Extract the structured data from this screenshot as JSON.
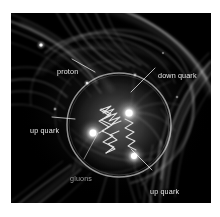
{
  "figure": {
    "alt_description": "Scientific illustration of the internal structure of a proton showing three valence quarks bound by gluon fields",
    "background_color": "#ffffff",
    "plate_color": "#000000",
    "label_color": "#e8e8e8",
    "glow_color": "#ffffff"
  },
  "annotations": [
    {
      "id": "proton",
      "label": "proton",
      "text_x": 46,
      "text_y": 55,
      "leader": {
        "x1": 72,
        "y1": 59,
        "x2": 95,
        "y2": 72
      },
      "dim": false
    },
    {
      "id": "down-quark",
      "label": "down quark",
      "text_x": 147,
      "text_y": 59,
      "leader": {
        "x1": 155,
        "y1": 68,
        "x2": 131,
        "y2": 92
      },
      "dim": false
    },
    {
      "id": "up-quark-left",
      "label": "up quark",
      "text_x": 19,
      "text_y": 114,
      "leader": {
        "x1": 52,
        "y1": 117,
        "x2": 75,
        "y2": 119
      },
      "dim": false
    },
    {
      "id": "gluons",
      "label": "gluons",
      "text_x": 59,
      "text_y": 162,
      "leader": {
        "x1": 84,
        "y1": 159,
        "x2": 98,
        "y2": 133
      },
      "dim": true
    },
    {
      "id": "up-quark-right",
      "label": "up quark",
      "text_x": 139,
      "text_y": 175,
      "leader": {
        "x1": 152,
        "y1": 170,
        "x2": 131,
        "y2": 149
      },
      "dim": false
    }
  ],
  "quarks": [
    {
      "id": "down-quark-node",
      "name": "down quark",
      "cx": 118,
      "cy": 100,
      "r": 7
    },
    {
      "id": "up-quark-node-left",
      "name": "up quark",
      "cx": 82,
      "cy": 120,
      "r": 7
    },
    {
      "id": "up-quark-node-lower",
      "name": "up quark",
      "cx": 123,
      "cy": 143,
      "r": 6.5
    }
  ],
  "proton_boundary": {
    "cx": 108,
    "cy": 112,
    "r": 52
  }
}
